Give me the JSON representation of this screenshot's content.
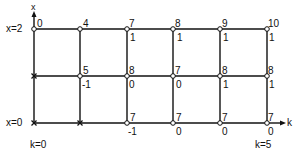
{
  "axes": {
    "x_label": "x",
    "k_label": "k"
  },
  "row_labels": {
    "top": "x=2",
    "bottom": "x=0"
  },
  "col_labels": {
    "left": "k=0",
    "right": "k=5"
  },
  "grid": {
    "k_count": 6,
    "x_count": 3,
    "top_values": [
      "0",
      "4",
      "7",
      "8",
      "9",
      "10"
    ],
    "top_subvalues": [
      "",
      "",
      "1",
      "1",
      "1",
      "1"
    ],
    "mid_values": [
      "",
      "5",
      "8",
      "7",
      "8",
      "8"
    ],
    "mid_subvalues": [
      "",
      "-1",
      "0",
      "0",
      "1",
      "1"
    ],
    "bot_values": [
      "",
      "",
      "7",
      "7",
      "7",
      "7"
    ],
    "bot_subvalues": [
      "",
      "",
      "-1",
      "0",
      "0",
      "0"
    ]
  }
}
